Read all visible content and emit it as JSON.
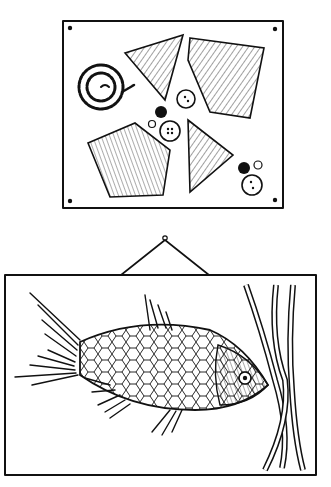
{
  "illustration": {
    "style": "black-and-white pen-and-ink drawing",
    "colors": {
      "ink": "#111111",
      "paper": "#ffffff"
    },
    "top_panel": {
      "description": "board pinned at four corners with craft materials",
      "items": [
        "coiled-rope",
        "fabric-triangle-1",
        "fabric-quad",
        "fabric-pentagon",
        "fabric-triangle-2",
        "buttons"
      ],
      "button_count": 7
    },
    "bottom_panel": {
      "description": "framed picture hanging on a nail by a string",
      "items": [
        "fish-made-of-fabric-scraps",
        "seaweed-strips"
      ],
      "seaweed_strip_count": 3
    }
  }
}
